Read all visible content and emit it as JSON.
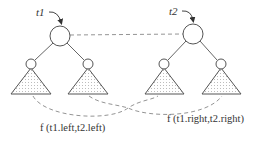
{
  "diagram": {
    "type": "tree-recursion",
    "trees": [
      {
        "root_label": "t1",
        "root": {
          "cx": 60,
          "cy": 36,
          "r": 10
        },
        "children": [
          {
            "side": "left",
            "cx": 31,
            "cy": 64,
            "r": 5
          },
          {
            "side": "right",
            "cx": 88,
            "cy": 64,
            "r": 5
          }
        ]
      },
      {
        "root_label": "t2",
        "root": {
          "cx": 193,
          "cy": 34,
          "r": 10
        },
        "children": [
          {
            "side": "left",
            "cx": 164,
            "cy": 64,
            "r": 5
          },
          {
            "side": "right",
            "cx": 221,
            "cy": 64,
            "r": 5
          }
        ]
      }
    ],
    "root_connector": "dashed line between t1 and t2 roots",
    "calls": [
      {
        "label": "f (t1.left,t2.left)",
        "connects": [
          "t1.left",
          "t2.left"
        ]
      },
      {
        "label": "f (t1.right,t2.right)",
        "connects": [
          "t1.right",
          "t2.right"
        ]
      }
    ],
    "colors": {
      "stroke": "#555555",
      "dashed": "#888888",
      "text": "#333333",
      "background": "#ffffff"
    }
  },
  "labels": {
    "t1": "t1",
    "t2": "t2",
    "call_left": "f (t1.left,t2.left)",
    "call_right": "f (t1.right,t2.right)"
  }
}
